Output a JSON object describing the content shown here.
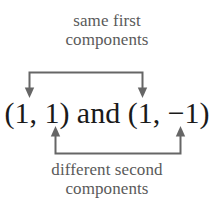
{
  "figure": {
    "type": "annotated-expression-diagram",
    "background_color": "#ffffff",
    "annotation_color": "#5a5a5a",
    "expression_color": "#1a1a1a",
    "connector_color": "#666666"
  },
  "top_annotation": {
    "line1": "same first",
    "line2": "components",
    "points_to": [
      "first component of first pair",
      "first component of second pair"
    ],
    "arrow_direction": "down"
  },
  "expression": {
    "text": "(1, 1) and (1, −1)",
    "first_pair": "(1, 1)",
    "conjunction": "and",
    "second_pair": "(1, −1)"
  },
  "bottom_annotation": {
    "line1": "different second",
    "line2": "components",
    "points_to": [
      "second component of first pair",
      "second component of second pair"
    ],
    "arrow_direction": "up"
  }
}
